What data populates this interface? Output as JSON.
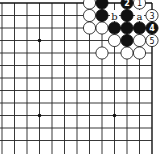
{
  "diagram": {
    "type": "go-board-fragment",
    "corner": "top-right",
    "columns_visible": 12,
    "rows_visible": 12,
    "colors": {
      "black_stone": "#111111",
      "white_stone": "#ffffff",
      "line": "#222222"
    },
    "hoshi": [
      {
        "col_from_right": 4,
        "row_from_top": 4
      },
      {
        "col_from_right": 10,
        "row_from_top": 4
      },
      {
        "col_from_right": 4,
        "row_from_top": 10
      },
      {
        "col_from_right": 10,
        "row_from_top": 10
      }
    ],
    "stones": [
      {
        "color": "white",
        "col_from_right": 6,
        "row_from_top": 1,
        "label": ""
      },
      {
        "color": "black",
        "col_from_right": 5,
        "row_from_top": 1,
        "label": ""
      },
      {
        "color": "black",
        "col_from_right": 3,
        "row_from_top": 1,
        "label": "2"
      },
      {
        "color": "white",
        "col_from_right": 2,
        "row_from_top": 1,
        "label": "1"
      },
      {
        "color": "white",
        "col_from_right": 6,
        "row_from_top": 2,
        "label": ""
      },
      {
        "color": "black",
        "col_from_right": 5,
        "row_from_top": 2,
        "label": ""
      },
      {
        "color": "black",
        "col_from_right": 3,
        "row_from_top": 2,
        "label": ""
      },
      {
        "color": "white",
        "col_from_right": 1,
        "row_from_top": 2,
        "label": "3"
      },
      {
        "color": "white",
        "col_from_right": 6,
        "row_from_top": 3,
        "label": ""
      },
      {
        "color": "white",
        "col_from_right": 5,
        "row_from_top": 3,
        "label": ""
      },
      {
        "color": "black",
        "col_from_right": 4,
        "row_from_top": 3,
        "label": ""
      },
      {
        "color": "black",
        "col_from_right": 3,
        "row_from_top": 3,
        "label": ""
      },
      {
        "color": "black",
        "col_from_right": 2,
        "row_from_top": 3,
        "label": ""
      },
      {
        "color": "black",
        "col_from_right": 1,
        "row_from_top": 3,
        "label": "4"
      },
      {
        "color": "white",
        "col_from_right": 4,
        "row_from_top": 4,
        "label": ""
      },
      {
        "color": "black",
        "col_from_right": 3,
        "row_from_top": 4,
        "label": ""
      },
      {
        "color": "white",
        "col_from_right": 2,
        "row_from_top": 4,
        "label": ""
      },
      {
        "color": "white",
        "col_from_right": 1,
        "row_from_top": 4,
        "label": "5"
      },
      {
        "color": "white",
        "col_from_right": 5,
        "row_from_top": 5,
        "label": ""
      },
      {
        "color": "white",
        "col_from_right": 3,
        "row_from_top": 5,
        "label": ""
      },
      {
        "color": "white",
        "col_from_right": 2,
        "row_from_top": 5,
        "label": ""
      }
    ],
    "markers": [
      {
        "text": "b",
        "col_from_right": 4,
        "row_from_top": 2
      },
      {
        "text": "a",
        "col_from_right": 2,
        "row_from_top": 2
      }
    ]
  }
}
